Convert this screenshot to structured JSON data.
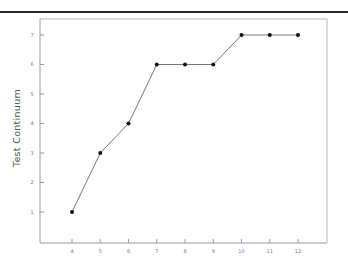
{
  "chart_data": {
    "type": "line",
    "title": "",
    "xlabel": "",
    "ylabel": "Test Continuum",
    "x": [
      4,
      5,
      6,
      7,
      8,
      9,
      10,
      11,
      12
    ],
    "series": [
      {
        "name": "Test Continuum",
        "values": [
          1,
          3,
          4,
          6,
          6,
          6,
          7,
          7,
          7
        ],
        "marker": "circle",
        "color": "#111111",
        "line_color": "#777777"
      }
    ],
    "x_ticks": [
      "4",
      "5",
      "6",
      "7",
      "8",
      "9",
      "10",
      "11",
      "12"
    ],
    "y_ticks": [
      "1",
      "2",
      "3",
      "4",
      "5",
      "6",
      "7"
    ],
    "xlim": [
      2.85,
      13.0
    ],
    "ylim": [
      0.0,
      7.55
    ],
    "grid": false,
    "legend": null
  },
  "colors": {
    "axis": "#9a9a9a",
    "frame": "#b5b5b5",
    "rule": "#2a2a2a",
    "marker": "#111111",
    "line": "#777777"
  }
}
